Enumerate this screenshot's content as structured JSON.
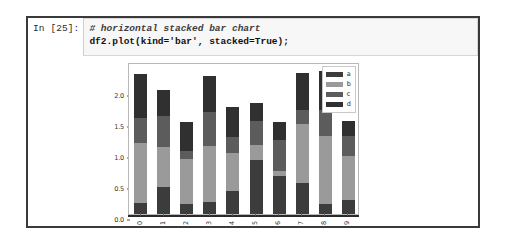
{
  "cell": {
    "prompt": "In [25]:",
    "code_comment": "# horizontal stacked bar chart",
    "code_statement": "df2.plot(kind='bar', stacked=True);"
  },
  "chart_data": {
    "type": "bar",
    "variant": "stacked",
    "title": "",
    "xlabel": "",
    "ylabel": "",
    "categories": [
      "0",
      "1",
      "2",
      "3",
      "4",
      "5",
      "6",
      "7",
      "8",
      "9"
    ],
    "series": [
      {
        "name": "a",
        "color": "#3c3c3c",
        "values": [
          0.17,
          0.43,
          0.16,
          0.2,
          0.37,
          0.87,
          0.62,
          0.5,
          0.16,
          0.22
        ]
      },
      {
        "name": "b",
        "color": "#9a9a9a",
        "values": [
          0.97,
          0.65,
          0.73,
          0.9,
          0.62,
          0.25,
          0.08,
          0.95,
          1.09,
          0.71
        ]
      },
      {
        "name": "c",
        "color": "#5c5c5c",
        "values": [
          0.41,
          0.5,
          0.12,
          0.54,
          0.25,
          0.38,
          0.49,
          0.23,
          0.43,
          0.32
        ]
      },
      {
        "name": "d",
        "color": "#303030",
        "values": [
          0.7,
          0.42,
          0.48,
          0.58,
          0.49,
          0.29,
          0.3,
          0.59,
          0.63,
          0.25
        ]
      }
    ],
    "totals": [
      2.25,
      2.0,
      1.49,
      2.22,
      1.73,
      1.79,
      1.49,
      2.27,
      2.31,
      1.5
    ],
    "yticks": [
      0.0,
      0.5,
      1.0,
      1.5,
      2.0
    ],
    "ytick_labels": [
      "0.0",
      "0.5",
      "1.0",
      "1.5",
      "2.0"
    ],
    "ylim": [
      0,
      2.45
    ],
    "grid": false,
    "legend_position": "upper right",
    "legend_entries": [
      "a",
      "b",
      "c",
      "d"
    ]
  },
  "style": {
    "cell_border": "#3a3a3a",
    "code_background": "#f7f7f7",
    "axes_border": "#b8b8b8",
    "axis_line": "#2a2a2a",
    "tick_text": "#2f2f2f"
  }
}
